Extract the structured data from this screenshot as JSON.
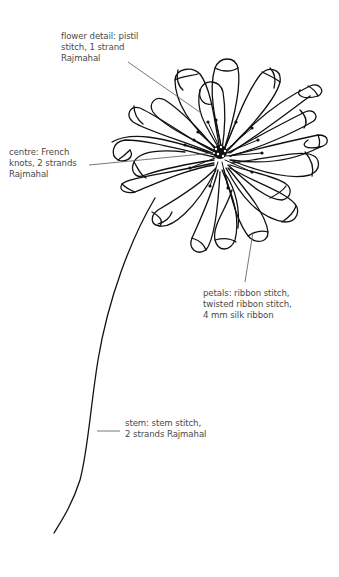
{
  "figure": {
    "line_color": "#111111",
    "leader_color": "#555555",
    "label_color": "#4a4a4a"
  },
  "labels": {
    "flower_detail": "flower detail: pistil\nstitch, 1 strand\nRajmahal",
    "centre": "centre: French\nknots, 2 strands\nRajmahal",
    "petals": "petals: ribbon stitch,\ntwisted ribbon stitch,\n4 mm silk ribbon",
    "stem": "stem: stem stitch,\n2 strands Rajmahal"
  }
}
